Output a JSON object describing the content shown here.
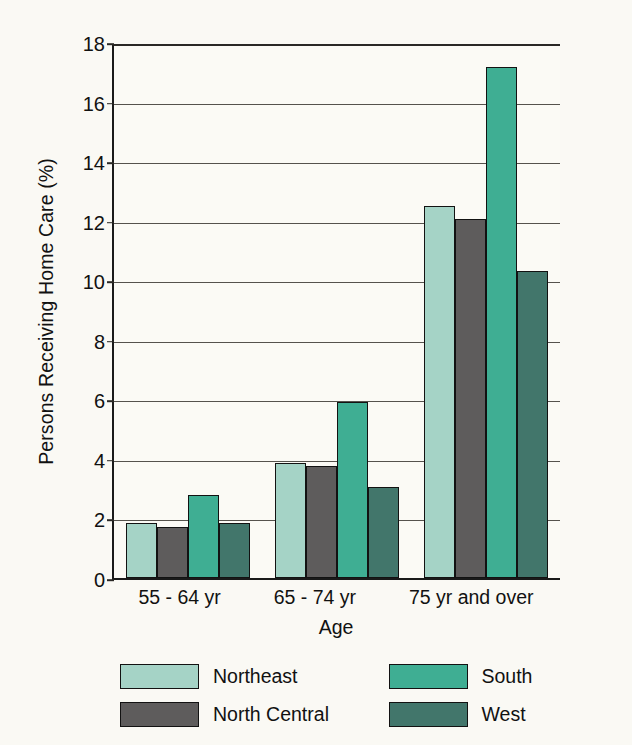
{
  "chart_data": {
    "type": "bar",
    "title": "",
    "xlabel": "Age",
    "ylabel": "Persons Receiving Home Care (%)",
    "categories": [
      "55 - 64 yr",
      "65 - 74 yr",
      "75 yr and over"
    ],
    "series": [
      {
        "name": "Northeast",
        "color": "#a5d3c6",
        "values": [
          1.85,
          3.85,
          12.5
        ]
      },
      {
        "name": "North Central",
        "color": "#5e5c5c",
        "values": [
          1.7,
          3.75,
          12.05
        ]
      },
      {
        "name": "South",
        "color": "#3fae93",
        "values": [
          2.8,
          5.9,
          17.15
        ]
      },
      {
        "name": "West",
        "color": "#42766b",
        "values": [
          1.85,
          3.05,
          10.3
        ]
      }
    ],
    "ylim": [
      0,
      18
    ],
    "yticks": [
      "0",
      "2",
      "4",
      "6",
      "8",
      "10",
      "12",
      "14",
      "16",
      "18"
    ],
    "ytick_values": [
      0,
      2,
      4,
      6,
      8,
      10,
      12,
      14,
      16,
      18
    ],
    "grid": true,
    "legend_position": "bottom"
  }
}
